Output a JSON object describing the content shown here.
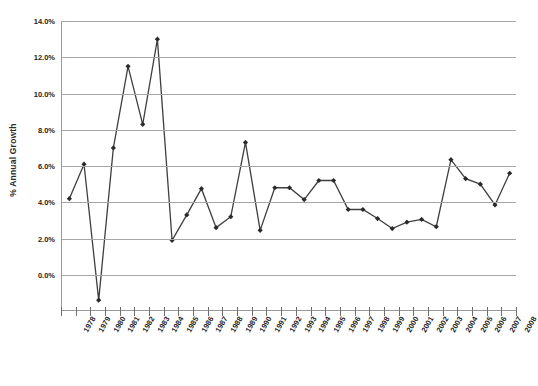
{
  "chart_data": {
    "type": "line",
    "title": "",
    "subtitle": "",
    "xlabel": "",
    "ylabel": "% Annual Growth",
    "ylim": [
      -2.0,
      14.0
    ],
    "ytick_values": [
      0.0,
      2.0,
      4.0,
      6.0,
      8.0,
      10.0,
      12.0,
      14.0
    ],
    "ytick_labels": [
      "0.0%",
      "2.0%",
      "4.0%",
      "6.0%",
      "8.0%",
      "10.0%",
      "12.0%",
      "14.0%"
    ],
    "grid": true,
    "legend": false,
    "legend_position": "none",
    "marker": "diamond",
    "line_color": "#3f3f3f",
    "marker_color": "#2b2b2b",
    "grid_color": "#a6a6a6",
    "axis_color": "#9a9a9a",
    "categories": [
      "1978",
      "1979",
      "1980",
      "1981",
      "1982",
      "1983",
      "1984",
      "1985",
      "1986",
      "1987",
      "1988",
      "1989",
      "1990",
      "1991",
      "1992",
      "1993",
      "1994",
      "1995",
      "1996",
      "1997",
      "1998",
      "1999",
      "2000",
      "2001",
      "2002",
      "2003",
      "2004",
      "2005",
      "2006",
      "2007",
      "2008"
    ],
    "values": [
      4.2,
      6.1,
      -1.4,
      7.0,
      11.5,
      8.3,
      13.0,
      1.9,
      3.3,
      4.75,
      2.6,
      3.2,
      7.3,
      2.45,
      4.8,
      4.8,
      4.15,
      5.2,
      5.2,
      3.6,
      3.6,
      3.1,
      2.55,
      2.9,
      3.05,
      2.65,
      6.35,
      5.3,
      5.0,
      3.85,
      5.6
    ]
  }
}
